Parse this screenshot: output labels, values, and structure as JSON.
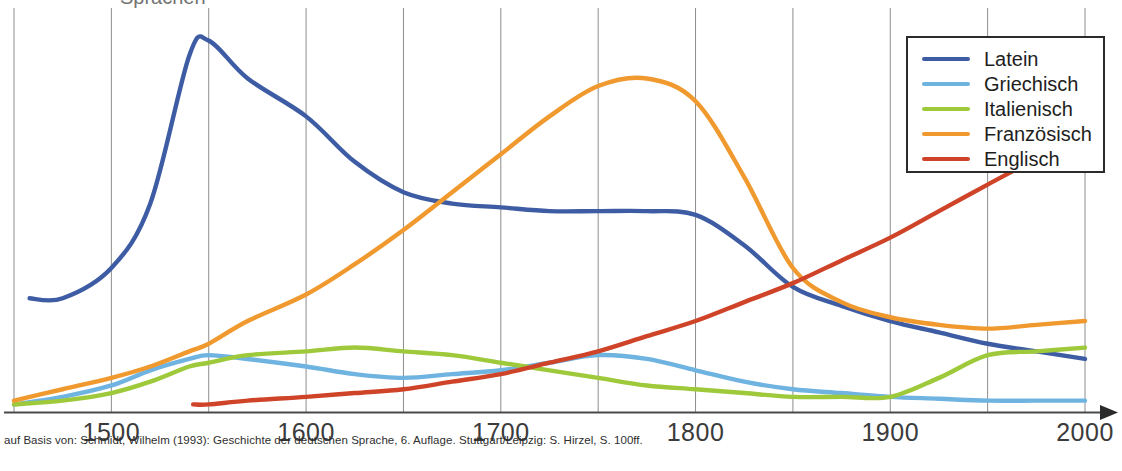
{
  "caption": "auf Basis von: Schmidt, Wilhelm (1993): Geschichte der deutschen Sprache, 6. Auflage. Stuttgart/Leipzig: S. Hirzel, S. 100ff.",
  "cropped_title": "Sprachen",
  "legend": {
    "position": "top-right",
    "entries": [
      {
        "label": "Latein",
        "color": "#3d5ca3"
      },
      {
        "label": "Griechisch",
        "color": "#6fb3e0"
      },
      {
        "label": "Italienisch",
        "color": "#9ec93a"
      },
      {
        "label": "Französisch",
        "color": "#f0992e"
      },
      {
        "label": "Englisch",
        "color": "#cf4428"
      }
    ]
  },
  "axis": {
    "tick_labels": [
      "1500",
      "1600",
      "1700",
      "1800",
      "1900",
      "2000"
    ],
    "tick_years": [
      1500,
      1600,
      1700,
      1800,
      1900,
      2000
    ],
    "gridline_years": [
      1450,
      1500,
      1550,
      1600,
      1650,
      1700,
      1750,
      1800,
      1850,
      1900,
      1950,
      2000
    ],
    "arrow": "right-arrow-icon"
  },
  "chart_data": {
    "type": "line",
    "xlabel": "",
    "ylabel": "",
    "xlim": [
      1443,
      1115
    ],
    "ylim": [
      0,
      100
    ],
    "grid": "vertical-only",
    "legend_position": "top-right",
    "x_tick_labels": [
      "1500",
      "1600",
      "1700",
      "1800",
      "1900",
      "2000"
    ],
    "x": [
      1450,
      1475,
      1500,
      1520,
      1540,
      1550,
      1570,
      1600,
      1625,
      1650,
      1675,
      1700,
      1725,
      1750,
      1775,
      1800,
      1825,
      1850,
      1875,
      1900,
      1925,
      1950,
      1975,
      2000
    ],
    "series": [
      {
        "name": "Latein",
        "color": "#3d5ca3",
        "x_start": 1458,
        "values": [
          null,
          30,
          38,
          55,
          94,
          98,
          88,
          78,
          66,
          58,
          55,
          54,
          53,
          53,
          53,
          52,
          44,
          33,
          28,
          24,
          21,
          18,
          16,
          14
        ]
      },
      {
        "name": "Griechisch",
        "color": "#6fb3e0",
        "x_start": 1450,
        "values": [
          2,
          4,
          7,
          11,
          14,
          15,
          14,
          12,
          10,
          9,
          10,
          11,
          13,
          15,
          14,
          11,
          8,
          6,
          5,
          4,
          3.5,
          3,
          3,
          3
        ]
      },
      {
        "name": "Italienisch",
        "color": "#9ec93a",
        "x_start": 1450,
        "values": [
          2,
          3,
          5,
          8,
          12,
          13,
          15,
          16,
          17,
          16,
          15,
          13,
          11,
          9,
          7,
          6,
          5,
          4,
          4,
          4,
          9,
          15,
          16,
          17
        ]
      },
      {
        "name": "Französisch",
        "color": "#f0992e",
        "x_start": 1450,
        "values": [
          3,
          6,
          9,
          12,
          16,
          18,
          24,
          31,
          39,
          48,
          58,
          68,
          78,
          86,
          88,
          82,
          62,
          38,
          29,
          25,
          23,
          22,
          23,
          24
        ]
      },
      {
        "name": "Englisch",
        "color": "#cf4428",
        "x_start": 1542,
        "values": [
          null,
          null,
          null,
          null,
          null,
          2,
          3,
          4,
          5,
          6,
          8,
          10,
          13,
          16,
          20,
          24,
          29,
          34,
          40,
          46,
          53,
          60,
          67,
          75
        ]
      }
    ]
  }
}
